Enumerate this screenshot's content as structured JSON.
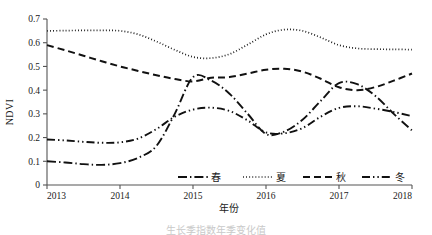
{
  "chart_data": {
    "type": "line",
    "title": "",
    "xlabel": "年份",
    "ylabel": "NDVI",
    "xlim": [
      2013,
      2018
    ],
    "ylim": [
      0,
      0.7
    ],
    "x_ticks": [
      "2013",
      "2014",
      "2015",
      "2016",
      "2017",
      "2018"
    ],
    "y_ticks": [
      "0",
      "0.1",
      "0.2",
      "0.3",
      "0.4",
      "0.5",
      "0.6",
      "0.7"
    ],
    "grid": false,
    "legend_position": "inside-bottom",
    "series": [
      {
        "name": "春",
        "legend_label": "春",
        "line_style": "dash-dot",
        "color": "#111111",
        "x": [
          2013,
          2013.25,
          2013.5,
          2013.75,
          2014,
          2014.25,
          2014.5,
          2014.75,
          2015,
          2015.25,
          2015.5,
          2015.75,
          2016,
          2016.25,
          2016.5,
          2016.75,
          2017,
          2017.25,
          2017.5,
          2017.75,
          2018
        ],
        "values": [
          0.1,
          0.095,
          0.088,
          0.085,
          0.092,
          0.115,
          0.165,
          0.3,
          0.455,
          0.44,
          0.385,
          0.3,
          0.215,
          0.225,
          0.275,
          0.355,
          0.43,
          0.425,
          0.375,
          0.3,
          0.23
        ]
      },
      {
        "name": "夏",
        "legend_label": "夏",
        "line_style": "dotted",
        "color": "#111111",
        "x": [
          2013,
          2013.25,
          2013.5,
          2013.75,
          2014,
          2014.25,
          2014.5,
          2014.75,
          2015,
          2015.25,
          2015.5,
          2015.75,
          2016,
          2016.25,
          2016.5,
          2016.75,
          2017,
          2017.25,
          2017.5,
          2017.75,
          2018
        ],
        "values": [
          0.65,
          0.651,
          0.652,
          0.652,
          0.65,
          0.635,
          0.605,
          0.57,
          0.54,
          0.535,
          0.552,
          0.592,
          0.635,
          0.655,
          0.65,
          0.622,
          0.59,
          0.576,
          0.573,
          0.572,
          0.571
        ]
      },
      {
        "name": "秋",
        "legend_label": "秋",
        "line_style": "dashed",
        "color": "#111111",
        "x": [
          2013,
          2013.25,
          2013.5,
          2013.75,
          2014,
          2014.25,
          2014.5,
          2014.75,
          2015,
          2015.25,
          2015.5,
          2015.75,
          2016,
          2016.25,
          2016.5,
          2016.75,
          2017,
          2017.25,
          2017.5,
          2017.75,
          2018
        ],
        "values": [
          0.59,
          0.568,
          0.545,
          0.522,
          0.5,
          0.481,
          0.463,
          0.447,
          0.437,
          0.452,
          0.455,
          0.47,
          0.486,
          0.49,
          0.478,
          0.448,
          0.412,
          0.4,
          0.413,
          0.44,
          0.47
        ]
      },
      {
        "name": "冬",
        "legend_label": "冬",
        "line_style": "dash-dot-dot",
        "color": "#111111",
        "x": [
          2013,
          2013.25,
          2013.5,
          2013.75,
          2014,
          2014.25,
          2014.5,
          2014.75,
          2015,
          2015.25,
          2015.5,
          2015.75,
          2016,
          2016.25,
          2016.5,
          2016.75,
          2017,
          2017.25,
          2017.5,
          2017.75,
          2018
        ],
        "values": [
          0.192,
          0.188,
          0.182,
          0.178,
          0.18,
          0.196,
          0.236,
          0.288,
          0.318,
          0.326,
          0.312,
          0.272,
          0.222,
          0.218,
          0.24,
          0.288,
          0.325,
          0.332,
          0.322,
          0.308,
          0.29
        ]
      }
    ]
  },
  "legend": {
    "items": [
      {
        "label": "春",
        "style": "dash-dot"
      },
      {
        "label": "夏",
        "style": "dotted"
      },
      {
        "label": "秋",
        "style": "dashed"
      },
      {
        "label": "冬",
        "style": "dash-dot-dot"
      }
    ]
  },
  "caption": {
    "text": "生长季指数年季变化值"
  }
}
